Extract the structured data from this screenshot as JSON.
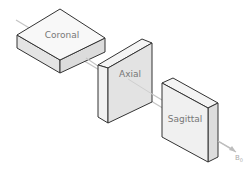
{
  "diagram": {
    "axis": {
      "label": "B",
      "subscript": "0",
      "color": "#bbbbbb"
    },
    "planes": [
      {
        "id": "coronal",
        "label": "Coronal"
      },
      {
        "id": "axial",
        "label": "Axial"
      },
      {
        "id": "sagittal",
        "label": "Sagittal"
      }
    ],
    "colors": {
      "face_light": "#f7f7f7",
      "face_mid": "#e8e8e8",
      "face_dark": "#dedede",
      "edge": "#333333",
      "text": "#777777"
    }
  }
}
